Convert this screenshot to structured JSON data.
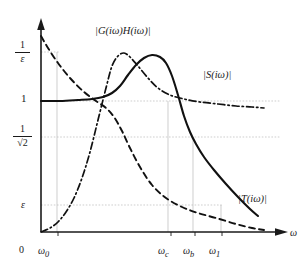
{
  "chart_data": {
    "type": "line",
    "title": "",
    "xlabel": "ω",
    "ylabel": "",
    "grid": true,
    "legend_position": "inline-annotations",
    "axis": {
      "x_arrow": true,
      "y_arrow": true,
      "x_range_label": [
        "0",
        "ω"
      ],
      "y_tick_labels": [
        "1/ε",
        "1",
        "1/√2",
        "ε",
        "0"
      ],
      "x_tick_labels": [
        "0",
        "ω₀",
        "ω_c",
        "ω_b",
        "ω₁"
      ]
    },
    "y_ticks": [
      {
        "id": "inv-eps",
        "numerator": "1",
        "denominator": "ε",
        "kind": "fraction",
        "pixel_y": 52
      },
      {
        "id": "one",
        "label": "1",
        "kind": "plain",
        "pixel_y": 99
      },
      {
        "id": "inv-sqrt2",
        "numerator": "1",
        "denominator": "√2",
        "kind": "fraction",
        "pixel_y": 137
      },
      {
        "id": "eps",
        "label": "ε",
        "kind": "plain",
        "pixel_y": 205
      },
      {
        "id": "zero",
        "label": "0",
        "kind": "origin",
        "pixel_y": 232
      }
    ],
    "x_ticks": [
      {
        "id": "zero",
        "label": "0",
        "sub": "",
        "pixel_x": 41
      },
      {
        "id": "w0",
        "label": "ω",
        "sub": "0",
        "pixel_x": 55
      },
      {
        "id": "wc",
        "label": "ω",
        "sub": "c",
        "pixel_x": 168
      },
      {
        "id": "wb",
        "label": "ω",
        "sub": "b",
        "pixel_x": 192
      },
      {
        "id": "w1",
        "label": "ω",
        "sub": "1",
        "pixel_x": 219
      }
    ],
    "series": [
      {
        "name": "open-loop-gain",
        "label": "|G(iω)H(iω)|",
        "style": "dashed",
        "color": "#111111",
        "description": "Open loop transfer function magnitude, monotonically decreasing from above 1/ε toward ε",
        "points": [
          [
            41,
            36
          ],
          [
            48,
            48
          ],
          [
            58,
            63
          ],
          [
            70,
            78
          ],
          [
            84,
            92
          ],
          [
            96,
            101
          ],
          [
            106,
            108
          ],
          [
            114,
            117
          ],
          [
            122,
            131
          ],
          [
            130,
            148
          ],
          [
            140,
            167
          ],
          [
            152,
            185
          ],
          [
            166,
            198
          ],
          [
            182,
            207
          ],
          [
            198,
            213
          ],
          [
            216,
            218
          ],
          [
            236,
            224
          ],
          [
            252,
            228
          ],
          [
            264,
            230
          ]
        ]
      },
      {
        "name": "sensitivity",
        "label": "|S(iω)|",
        "style": "dash-dot",
        "color": "#111111",
        "description": "Sensitivity function, rises from ε at low frequency, overshoots above 1, settles near 1",
        "points": [
          [
            41,
            232
          ],
          [
            50,
            228
          ],
          [
            58,
            222
          ],
          [
            66,
            212
          ],
          [
            74,
            198
          ],
          [
            82,
            178
          ],
          [
            90,
            152
          ],
          [
            98,
            120
          ],
          [
            106,
            88
          ],
          [
            112,
            66
          ],
          [
            118,
            56
          ],
          [
            124,
            53
          ],
          [
            130,
            57
          ],
          [
            138,
            66
          ],
          [
            148,
            78
          ],
          [
            158,
            88
          ],
          [
            170,
            95
          ],
          [
            184,
            99
          ],
          [
            200,
            102
          ],
          [
            218,
            104
          ],
          [
            236,
            106
          ],
          [
            252,
            107
          ],
          [
            264,
            108
          ]
        ]
      },
      {
        "name": "complementary-sensitivity",
        "label": "|T(iω)|",
        "style": "solid",
        "color": "#111111",
        "description": "Complementary sensitivity, flat at 1 for low frequency, resonant peak above 1/ε near ω between ω_0 and ω_c, then rolls off through 1/√2 at ω_b",
        "points": [
          [
            41,
            101
          ],
          [
            60,
            101
          ],
          [
            78,
            100
          ],
          [
            92,
            99
          ],
          [
            103,
            97
          ],
          [
            112,
            93
          ],
          [
            120,
            86
          ],
          [
            128,
            75
          ],
          [
            136,
            65
          ],
          [
            144,
            58
          ],
          [
            152,
            55
          ],
          [
            160,
            57
          ],
          [
            166,
            63
          ],
          [
            172,
            76
          ],
          [
            178,
            95
          ],
          [
            184,
            116
          ],
          [
            190,
            132
          ],
          [
            196,
            144
          ],
          [
            204,
            157
          ],
          [
            214,
            170
          ],
          [
            226,
            184
          ],
          [
            238,
            197
          ],
          [
            250,
            209
          ],
          [
            258,
            216
          ]
        ]
      }
    ],
    "gridlines": {
      "horizontal": [
        {
          "for": "inv-eps",
          "y": 52,
          "x_from": 41,
          "x_to": 60
        },
        {
          "for": "one",
          "y": 101,
          "x_from": 41,
          "x_to": 280
        },
        {
          "for": "inv-sqrt2",
          "y": 137,
          "x_from": 41,
          "x_to": 280
        },
        {
          "for": "eps",
          "y": 205,
          "x_from": 41,
          "x_to": 222
        }
      ],
      "vertical": [
        {
          "for": "w0",
          "x": 57,
          "y_from": 52,
          "y_to": 232
        },
        {
          "for": "wc",
          "x": 168,
          "y_from": 101,
          "y_to": 232
        },
        {
          "for": "wb",
          "x": 193,
          "y_from": 137,
          "y_to": 232
        },
        {
          "for": "w1",
          "x": 221,
          "y_from": 205,
          "y_to": 232
        }
      ]
    }
  }
}
